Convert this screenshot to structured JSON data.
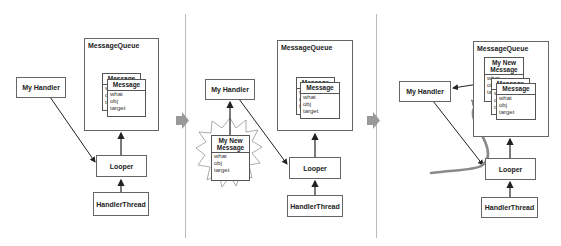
{
  "panels": [
    {
      "handler_label": "My Handler",
      "queue_label": "MessageQueue",
      "looper_label": "Looper",
      "thread_label": "HandlerThread",
      "messages": [
        {
          "header": "Message",
          "fields": [
            "what",
            "obj",
            "target"
          ]
        },
        {
          "header": "Message",
          "fields": [
            "what",
            "obj",
            "target"
          ]
        }
      ]
    },
    {
      "handler_label": "My Handler",
      "queue_label": "MessageQueue",
      "looper_label": "Looper",
      "thread_label": "HandlerThread",
      "new_message": {
        "header_line1": "My New",
        "header_line2": "Message",
        "fields": [
          "what",
          "obj",
          "target"
        ]
      },
      "messages": [
        {
          "header": "Message",
          "fields": [
            "what",
            "obj",
            "target"
          ]
        },
        {
          "header": "Message",
          "fields": [
            "what",
            "obj",
            "target"
          ]
        }
      ]
    },
    {
      "handler_label": "My Handler",
      "queue_label": "MessageQueue",
      "looper_label": "Looper",
      "thread_label": "HandlerThread",
      "new_message": {
        "header_line1": "My New",
        "header_line2": "Message",
        "fields": [
          "what",
          "obj",
          "target"
        ]
      },
      "messages": [
        {
          "header": "Message",
          "fields": [
            "what",
            "obj",
            "target"
          ]
        },
        {
          "header": "Message",
          "fields": [
            "what",
            "obj",
            "target"
          ]
        }
      ]
    }
  ],
  "colors": {
    "box_border": "#666666",
    "arrow": "#222222",
    "step_arrow": "#999999",
    "flow_curve": "#8a8a8a",
    "divider": "#bbbbbb"
  }
}
